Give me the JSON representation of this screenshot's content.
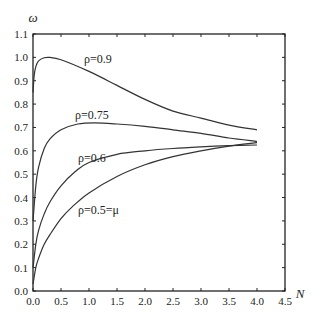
{
  "chart_data": {
    "type": "line",
    "title": "",
    "xlabel": "N",
    "ylabel": "ω",
    "xlim": [
      0,
      4.5
    ],
    "ylim": [
      0,
      1.1
    ],
    "grid": false,
    "legend": "inline curve labels",
    "xticks": [
      "0.0",
      "0.5",
      "1.0",
      "1.5",
      "2.0",
      "2.5",
      "3.0",
      "3.5",
      "4.0",
      "4.5"
    ],
    "yticks": [
      "0.0",
      "0.1",
      "0.2",
      "0.3",
      "0.4",
      "0.5",
      "0.6",
      "0.7",
      "0.8",
      "0.9",
      "1.0",
      "1.1"
    ],
    "series": [
      {
        "name": "ρ=0.9",
        "x": [
          0.0,
          0.02,
          0.05,
          0.1,
          0.2,
          0.3,
          0.5,
          1.0,
          1.5,
          2.0,
          2.5,
          3.0,
          3.5,
          4.0
        ],
        "values": [
          0.85,
          0.92,
          0.96,
          0.985,
          0.998,
          1.0,
          0.99,
          0.94,
          0.88,
          0.82,
          0.77,
          0.74,
          0.71,
          0.69
        ]
      },
      {
        "name": "ρ=0.75",
        "x": [
          0.0,
          0.05,
          0.1,
          0.2,
          0.3,
          0.5,
          0.8,
          1.1,
          1.5,
          2.0,
          2.5,
          3.0,
          3.5,
          4.0
        ],
        "values": [
          0.3,
          0.45,
          0.53,
          0.61,
          0.65,
          0.69,
          0.715,
          0.72,
          0.715,
          0.705,
          0.69,
          0.675,
          0.655,
          0.64
        ]
      },
      {
        "name": "ρ=0.6",
        "x": [
          0.0,
          0.05,
          0.1,
          0.2,
          0.3,
          0.5,
          0.75,
          1.0,
          1.5,
          2.0,
          2.5,
          3.0,
          3.5,
          4.0
        ],
        "values": [
          0.1,
          0.2,
          0.26,
          0.33,
          0.38,
          0.45,
          0.51,
          0.55,
          0.585,
          0.6,
          0.61,
          0.617,
          0.622,
          0.625
        ]
      },
      {
        "name": "ρ=0.5=μ",
        "x": [
          0.0,
          0.05,
          0.1,
          0.2,
          0.3,
          0.5,
          0.7,
          1.0,
          1.5,
          2.0,
          2.5,
          3.0,
          3.5,
          4.0
        ],
        "values": [
          0.03,
          0.1,
          0.14,
          0.2,
          0.24,
          0.31,
          0.36,
          0.42,
          0.49,
          0.54,
          0.575,
          0.6,
          0.62,
          0.635
        ]
      }
    ],
    "annotations": [
      {
        "text": "ρ=0.9",
        "x": 0.9,
        "y": 0.96
      },
      {
        "text": "ρ=0.75",
        "x": 0.9,
        "y": 0.72
      },
      {
        "text": "ρ=0.6",
        "x": 0.95,
        "y": 0.55
      },
      {
        "text": "ρ=0.5=μ",
        "x": 0.95,
        "y": 0.4
      }
    ]
  },
  "labels": {
    "xaxis": "N",
    "yaxis": "ω",
    "curve_09": "ρ=0.9",
    "curve_075": "ρ=0.75",
    "curve_06": "ρ=0.6",
    "curve_05": "ρ=0.5=μ"
  },
  "colors": {
    "line": "#333333",
    "axis": "#222222",
    "background": "#ffffff"
  }
}
